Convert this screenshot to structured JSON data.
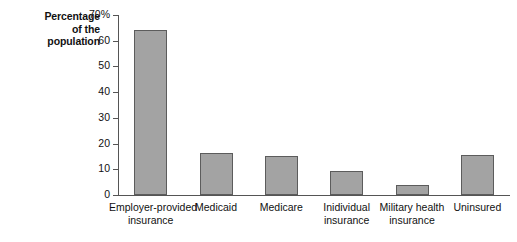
{
  "chart_data": {
    "type": "bar",
    "title": "",
    "subtitle": "",
    "xlabel": "",
    "ylabel": "Percentage of the population",
    "ylabel_lines": [
      "Percentage",
      "of the",
      "population"
    ],
    "categories": [
      "Employer-provided insurance",
      "Medicaid",
      "Medicare",
      "Inidividual insurance",
      "Military health insurance",
      "Uninsured"
    ],
    "category_lines": [
      [
        "Employer-provided",
        "insurance"
      ],
      [
        "Medicaid"
      ],
      [
        "Medicare"
      ],
      [
        "Inidividual",
        "insurance"
      ],
      [
        "Military health",
        "insurance"
      ],
      [
        "Uninsured"
      ]
    ],
    "values": [
      64,
      16.5,
      15,
      9.5,
      4,
      15.5
    ],
    "ylim": [
      0,
      70
    ],
    "ytick_values": [
      0,
      10,
      20,
      30,
      40,
      50,
      60,
      70
    ],
    "ytick_labels": [
      "0",
      "10",
      "20",
      "30",
      "40",
      "50",
      "60",
      "70%"
    ],
    "grid": false,
    "legend": false,
    "legend_position": "none",
    "bar_color": "#a3a3a3",
    "bar_edge_color": "#5c5c5c",
    "axis_color": "#555555",
    "text_color": "#111111",
    "background_color": "#ffffff"
  }
}
